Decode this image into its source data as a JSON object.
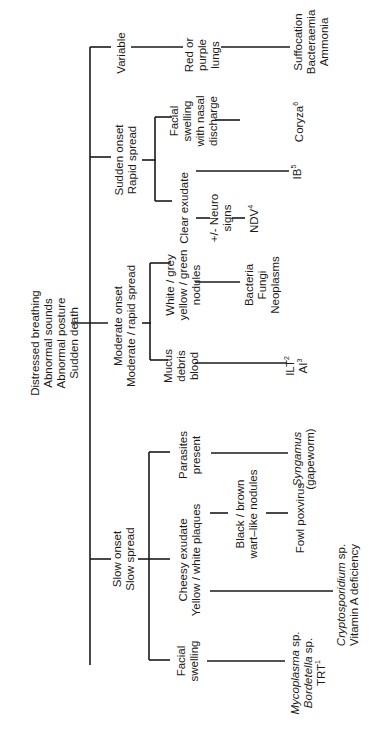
{
  "diagram": {
    "orientation": "rotated-90-ccw",
    "root": [
      "Distressed breathing",
      "Abnormal sounds",
      "Abnormal posture",
      "Sudden death"
    ],
    "branches": {
      "variable": {
        "label": [
          "Variable"
        ],
        "finding": [
          "Red or",
          "purple",
          "lungs"
        ],
        "causes": [
          "Suffocation",
          "Bacteraemia",
          "Ammonia"
        ]
      },
      "sudden": {
        "label": [
          "Sudden onset",
          "Rapid spread"
        ],
        "children": {
          "facial": {
            "label": [
              "Facial",
              "swelling",
              "with nasal",
              "discharge"
            ],
            "cause": "Coryza",
            "cause_sup": "6"
          },
          "clear": {
            "label": [
              "Clear exudate"
            ],
            "neuro": [
              "+/- Neuro",
              "signs"
            ],
            "cause_ndv": "NDV",
            "cause_ndv_sup": "4",
            "cause_ib": "IB",
            "cause_ib_sup": "5"
          }
        }
      },
      "moderate": {
        "label": [
          "Moderate onset",
          "Moderate / rapid spread"
        ],
        "children": {
          "nodules": {
            "label": [
              "White / grey",
              "yellow / green",
              "nodules"
            ],
            "causes": [
              "Bacteria",
              "Fungi",
              "Neoplasms"
            ]
          },
          "mucus": {
            "label": [
              "Mucus",
              "debris",
              "blood"
            ],
            "cause_ilt": "ILT",
            "cause_ilt_sup": "2",
            "cause_ai": "AI",
            "cause_ai_sup": "3"
          }
        }
      },
      "slow": {
        "label": [
          "Slow onset",
          "Slow spread"
        ],
        "children": {
          "parasites": {
            "label": [
              "Parasites",
              "present"
            ],
            "cause": "Syngamus",
            "cause_note": "(gapeworm)"
          },
          "cheesy": {
            "label": [
              "Cheesy exudate",
              "Yellow / white plaques"
            ],
            "sub": [
              "Black / brown",
              "wart–like nodules"
            ],
            "sub_cause": "Fowl poxvirus",
            "cause_crypto": "Cryptosporidium",
            "cause_crypto_suffix": " sp.",
            "cause_vita": "Vitamin A deficiency"
          },
          "facial": {
            "label": [
              "Facial",
              "swelling"
            ],
            "cause_myco": "Mycoplasma",
            "cause_myco_suffix": " sp.",
            "cause_bord": "Bordetella",
            "cause_bord_suffix": " sp.",
            "cause_trt": "TRT",
            "cause_trt_sup": "1"
          }
        }
      }
    }
  }
}
